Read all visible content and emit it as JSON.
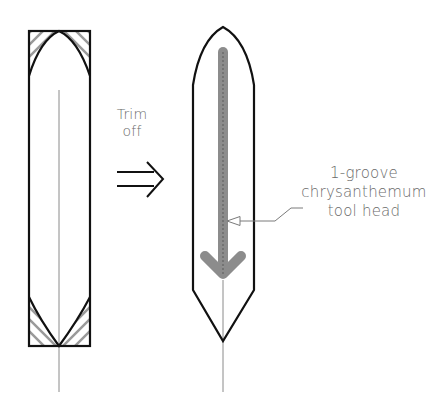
{
  "diagram": {
    "trim_label": {
      "line1": "Trim",
      "line2": "off"
    },
    "callout_label": {
      "line1": "1-groove",
      "line2": "chrysanthemum",
      "line3": "tool head"
    },
    "colors": {
      "outline": "#111111",
      "hatch": "#9a9a9a",
      "center_line": "#8a8a8a",
      "tool_path": "#8c8c8c",
      "leader": "#7a7a7a",
      "text": "#6a6a6a"
    },
    "shapes": [
      {
        "name": "rectangular-blank",
        "description": "Rectangle blank with pointed ends marked and hatched corners to trim off"
      },
      {
        "name": "trimmed-blade",
        "description": "Pointed blade shape with downward tool path arrow"
      }
    ]
  }
}
